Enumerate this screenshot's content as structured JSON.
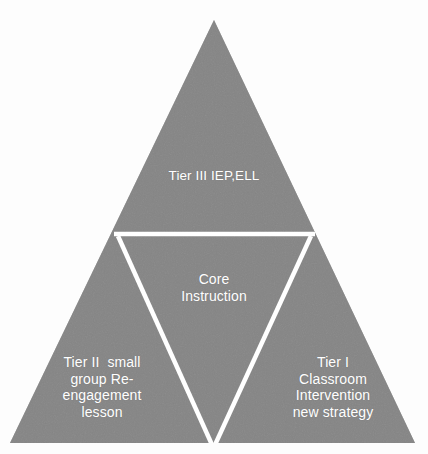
{
  "diagram": {
    "type": "pyramid-triangle",
    "background_color": "#fdfdfd",
    "fill_color": "#808080",
    "divider_color": "#ffffff",
    "text_color": "#ffffff",
    "sections": {
      "top": {
        "name": "Tier III",
        "text": "Tier III IEP,ELL"
      },
      "center": {
        "name": "Core Instruction",
        "line1": "Core",
        "line2": "Instruction",
        "text": "Core\nInstruction"
      },
      "bottom_left": {
        "name": "Tier II",
        "line1": "Tier II  small",
        "line2": "group Re-",
        "line3": "engagement",
        "line4": "lesson",
        "text": "Tier II  small\ngroup Re-\nengagement\nlesson"
      },
      "bottom_right": {
        "name": "Tier I",
        "line1": "Tier I",
        "line2": "Classroom",
        "line3": "Intervention",
        "line4": "new strategy",
        "text": "Tier I\nClassroom\nIntervention\nnew strategy"
      }
    }
  }
}
